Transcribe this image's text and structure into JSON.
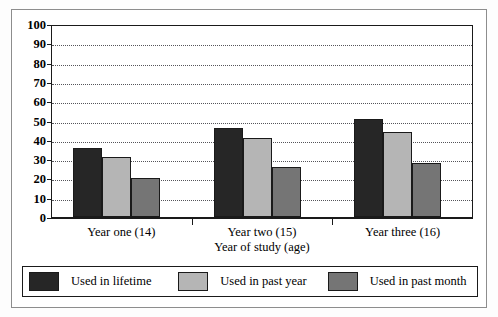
{
  "chart_data": {
    "type": "bar",
    "title": "",
    "xlabel": "Year of study (age)",
    "ylabel": "",
    "categories": [
      "Year one (14)",
      "Year two (15)",
      "Year three (16)"
    ],
    "series": [
      {
        "name": "Used in lifetime",
        "values": [
          36,
          46,
          51
        ],
        "color": "#262626"
      },
      {
        "name": "Used in past year",
        "values": [
          31,
          41,
          44
        ],
        "color": "#b5b5b5"
      },
      {
        "name": "Used in past month",
        "values": [
          20,
          26,
          28
        ],
        "color": "#757575"
      }
    ],
    "ylim": [
      0,
      100
    ],
    "yticks": [
      0,
      10,
      20,
      30,
      40,
      50,
      60,
      70,
      80,
      90,
      100
    ],
    "ytick_labels": [
      "0",
      "10",
      "20",
      "30",
      "40",
      "50",
      "60",
      "70",
      "80",
      "90",
      "100"
    ],
    "grid": true,
    "legend_position": "bottom",
    "legend_entries": [
      "Used in lifetime",
      "Used in past year",
      "Used in past month"
    ]
  },
  "axis": {
    "x_title": "Year of study (age)"
  },
  "colors": {
    "lifetime": "#262626",
    "past_year": "#b5b5b5",
    "past_month": "#757575",
    "frame": "#8d8d8d",
    "axis": "#1a1a1a",
    "grid": "#55555a"
  }
}
